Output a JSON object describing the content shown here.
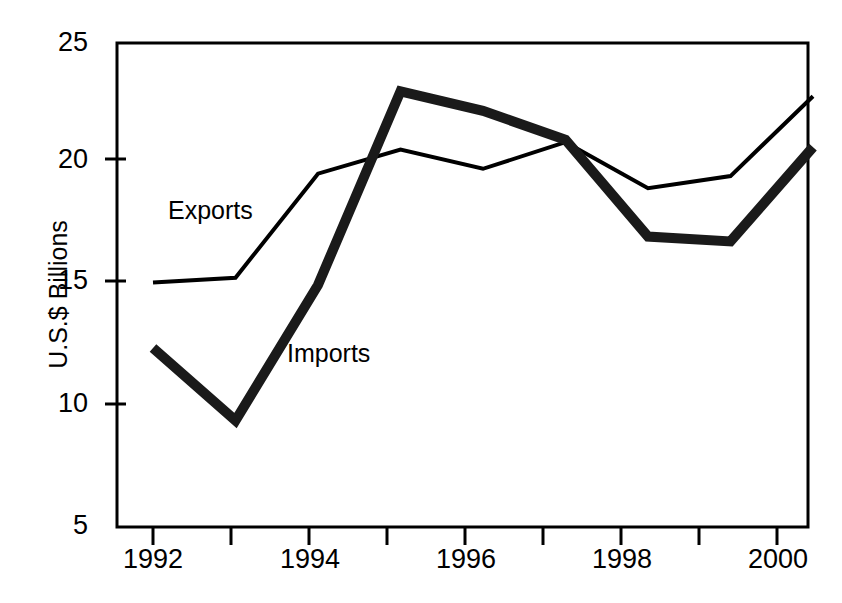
{
  "chart_data": {
    "type": "line",
    "title": "",
    "subtitle": "",
    "xlabel": "",
    "ylabel": "U.S.$ Billions",
    "x": [
      1992,
      1993,
      1994,
      1995,
      1996,
      1997,
      1998,
      1999,
      2000
    ],
    "xtick_labels": [
      "1992",
      "1994",
      "1996",
      "1998",
      "2000"
    ],
    "xtick_values": [
      1992,
      1994,
      1996,
      1998,
      2000
    ],
    "xtick_minor_values": [
      1993,
      1995,
      1997,
      1999
    ],
    "xlim": [
      1992,
      2000
    ],
    "ytick_labels": [
      "5",
      "10",
      "15",
      "20",
      "25"
    ],
    "ytick_values": [
      5,
      10,
      15,
      20,
      25
    ],
    "ylim": [
      5,
      25
    ],
    "grid": false,
    "legend_position": "inline-annotations",
    "series": [
      {
        "name": "Exports",
        "style": "thin-line",
        "color": "#000000",
        "label_x": 1992.75,
        "label_y": 17.8,
        "values": [
          15.1,
          15.3,
          19.6,
          20.6,
          19.8,
          20.9,
          19.0,
          19.5,
          22.8
        ]
      },
      {
        "name": "Imports",
        "style": "thick-line",
        "color": "#1a1a1a",
        "label_x": 1994.2,
        "label_y": 12.6,
        "values": [
          12.4,
          9.4,
          15.0,
          23.0,
          22.2,
          21.0,
          17.0,
          16.8,
          20.7
        ]
      }
    ],
    "annotations": [
      {
        "text": "Exports",
        "x": 1992.75,
        "y": 17.8
      },
      {
        "text": "Imports",
        "x": 1994.2,
        "y": 12.6
      }
    ]
  },
  "axis": {
    "y_title": "U.S.$ Billions"
  }
}
